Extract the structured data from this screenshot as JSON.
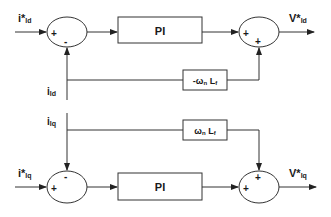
{
  "diagram": {
    "type": "block-diagram",
    "d_axis": {
      "input_ref": {
        "main": "i*",
        "sub": "ld"
      },
      "feedback": {
        "main": "i",
        "sub": "ld"
      },
      "sum1_signs": {
        "left": "+",
        "bottom": "-"
      },
      "controller": "PI",
      "decoupling": {
        "prefix": "-ω",
        "sub": "n",
        "suffix": " L",
        "sub2": "f"
      },
      "sum2_signs": {
        "left": "+",
        "bottom": "+"
      },
      "output": {
        "main": "V*",
        "sub": "ld"
      }
    },
    "q_axis": {
      "feedback": {
        "main": "i",
        "sub": "lq"
      },
      "input_ref": {
        "main": "i*",
        "sub": "lq"
      },
      "sum1_signs": {
        "left": "+",
        "top": "-"
      },
      "controller": "PI",
      "decoupling": {
        "prefix": "ω",
        "sub": "n",
        "suffix": " L",
        "sub2": "f"
      },
      "sum2_signs": {
        "left": "+",
        "top": "+"
      },
      "output": {
        "main": "V*",
        "sub": "lq"
      }
    },
    "colors": {
      "line": "#333333",
      "text": "#1a1a1a",
      "background": "#ffffff"
    }
  }
}
